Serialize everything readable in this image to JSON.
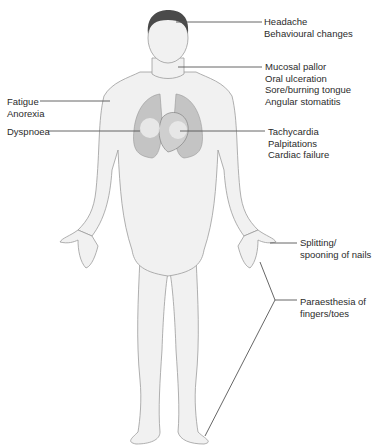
{
  "diagram": {
    "type": "anatomical-figure",
    "colors": {
      "line": "#555555",
      "skin": "#f0f0f0",
      "outline": "#9a9a9a",
      "hair": "#4a4a4a",
      "lungs": "#bdbdbd",
      "heart": "#a8a8a8"
    }
  },
  "labels": {
    "head": [
      "Headache",
      "Behavioural changes"
    ],
    "mouth": [
      "Mucosal pallor",
      "Oral ulceration",
      "Sore/burning tongue",
      "Angular stomatitis"
    ],
    "shoulder": [
      "Fatigue",
      "Anorexia"
    ],
    "lung": [
      "Dyspnoea"
    ],
    "heart": [
      "Tachycardia",
      "Palpitations",
      "Cardiac failure"
    ],
    "nails": [
      "Splitting/",
      "spooning of nails"
    ],
    "extremities": [
      "Paraesthesia of",
      "fingers/toes"
    ]
  }
}
